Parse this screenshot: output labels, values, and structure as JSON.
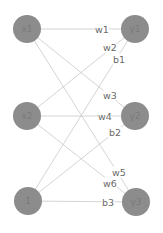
{
  "diagram": {
    "type": "neural-network",
    "colors": {
      "node_fill": "#8c8c8c",
      "node_text": "#7a7a7a",
      "edge": "#c9c9c9",
      "label_text": "#6a6a6a",
      "background": "#ffffff"
    },
    "nodes": [
      {
        "id": "x1",
        "label": "x1",
        "cx": 27,
        "cy": 29,
        "r": 14
      },
      {
        "id": "x2",
        "label": "x2",
        "cx": 27,
        "cy": 116,
        "r": 14
      },
      {
        "id": "bias",
        "label": "1",
        "cx": 28,
        "cy": 201,
        "r": 14
      },
      {
        "id": "y1",
        "label": "y1",
        "cx": 135,
        "cy": 29,
        "r": 14
      },
      {
        "id": "y2",
        "label": "y2",
        "cx": 135,
        "cy": 116,
        "r": 14
      },
      {
        "id": "y3",
        "label": "y3",
        "cx": 136,
        "cy": 202,
        "r": 14
      }
    ],
    "edges": [
      {
        "from": "x1",
        "to": "y1",
        "label": "w1",
        "lx": 102,
        "ly": 29
      },
      {
        "from": "x2",
        "to": "y1",
        "label": "w2",
        "lx": 110,
        "ly": 47
      },
      {
        "from": "bias",
        "to": "y1",
        "label": "b1",
        "lx": 119,
        "ly": 59
      },
      {
        "from": "x1",
        "to": "y2",
        "label": "w3",
        "lx": 110,
        "ly": 95
      },
      {
        "from": "x2",
        "to": "y2",
        "label": "w4",
        "lx": 105,
        "ly": 116
      },
      {
        "from": "bias",
        "to": "y2",
        "label": "b2",
        "lx": 115,
        "ly": 132
      },
      {
        "from": "x1",
        "to": "y3",
        "label": "w5",
        "lx": 119,
        "ly": 172
      },
      {
        "from": "x2",
        "to": "y3",
        "label": "w6",
        "lx": 110,
        "ly": 183
      },
      {
        "from": "bias",
        "to": "y3",
        "label": "b3",
        "lx": 108,
        "ly": 202
      }
    ]
  }
}
